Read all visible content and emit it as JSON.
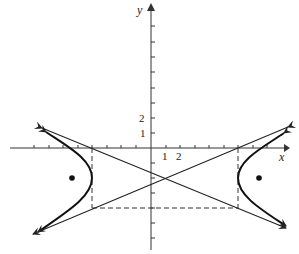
{
  "figure": {
    "type": "hyperbola-graph",
    "axes": {
      "x_label": "x",
      "y_label": "y",
      "x_tick_labels": [
        "1",
        "2"
      ],
      "y_tick_labels": [
        "1",
        "2"
      ],
      "x_range": [
        -8,
        9
      ],
      "y_range": [
        -7,
        9
      ]
    },
    "hyperbola": {
      "center": [
        1,
        -2
      ],
      "a": 5,
      "b": 2,
      "orientation": "horizontal",
      "foci_marked": true
    },
    "asymptotes": 2,
    "fundamental_rectangle": "dashed",
    "colors": {
      "ink": "#222222",
      "background": "#ffffff"
    }
  }
}
